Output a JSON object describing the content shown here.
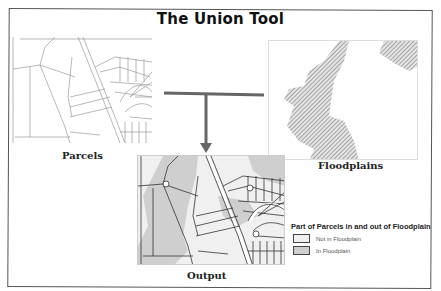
{
  "title": "The Union Tool",
  "inputs": [
    {
      "name": "parcels",
      "caption": "Parcels"
    },
    {
      "name": "floodplains",
      "caption": "Floodplains"
    }
  ],
  "output": {
    "caption": "Output"
  },
  "legend": {
    "title": "Part of Parcels in and out of Floodplain",
    "items": [
      {
        "label": "Not in Floodplain",
        "color": "#f0f0f0"
      },
      {
        "label": "In Floodplain",
        "color": "#cfcfcf"
      }
    ]
  },
  "colors": {
    "connector": "#666666",
    "floodplain_hatch": "#9a9a9a",
    "parcel_lines": "#8a8a8a",
    "output_lines": "#333333"
  }
}
